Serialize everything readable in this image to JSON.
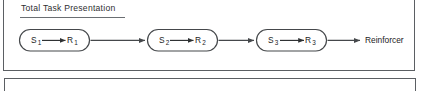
{
  "figure": {
    "background_color": "#ffffff",
    "line_color": "#4a4d50",
    "text_color": "#232325",
    "border_color": "#5b5f63"
  },
  "panel_top": {
    "title": "Total Task Presentation",
    "title_underlined": true
  },
  "chain": {
    "nodes": [
      {
        "id": "node-1",
        "stimulus": "S",
        "stimulus_subscript": "1",
        "response": "R",
        "response_subscript": "1",
        "inner_arrow": "→",
        "shape": "stadium"
      },
      {
        "id": "node-2",
        "stimulus": "S",
        "stimulus_subscript": "2",
        "response": "R",
        "response_subscript": "2",
        "inner_arrow": "→",
        "shape": "stadium"
      },
      {
        "id": "node-3",
        "stimulus": "S",
        "stimulus_subscript": "3",
        "response": "R",
        "response_subscript": "3",
        "inner_arrow": "→",
        "shape": "stadium"
      }
    ],
    "connectors": [
      {
        "id": "connector-1-2",
        "from": "node-1",
        "to": "node-2",
        "arrowhead": true
      },
      {
        "id": "connector-2-3",
        "from": "node-2",
        "to": "node-3",
        "arrowhead": true
      },
      {
        "id": "connector-3-terminal",
        "from": "node-3",
        "to": "terminal",
        "arrowhead": true
      }
    ],
    "terminal": {
      "id": "terminal",
      "label": "Reinforcer"
    }
  },
  "panel_bottom": {
    "content": ""
  }
}
